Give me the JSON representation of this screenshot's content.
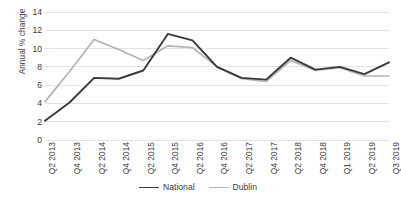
{
  "chart_data": {
    "type": "line",
    "title": "",
    "xlabel": "",
    "ylabel": "Annual % change",
    "ylim": [
      0,
      14
    ],
    "yticks": [
      0,
      2,
      4,
      6,
      8,
      10,
      12,
      14
    ],
    "grid": true,
    "legend_position": "bottom",
    "categories": [
      "Q2 2013",
      "Q4 2013",
      "Q2 2014",
      "Q4 2014",
      "Q2 2015",
      "Q4 2015",
      "Q2 2016",
      "Q4 2016",
      "Q2 2017",
      "Q4 2017",
      "Q2 2018",
      "Q4 2018",
      "Q1 2019",
      "Q2 2019",
      "Q3 2019"
    ],
    "series": [
      {
        "name": "National",
        "color": "#3a3a3a",
        "values": [
          2.1,
          4.1,
          6.8,
          6.7,
          7.6,
          11.6,
          10.9,
          8.0,
          6.8,
          6.6,
          9.0,
          7.7,
          8.0,
          7.2,
          8.5
        ]
      },
      {
        "name": "Dublin",
        "color": "#b4b4b4",
        "values": [
          4.2,
          7.5,
          11.0,
          9.9,
          8.7,
          10.3,
          10.1,
          8.0,
          6.7,
          6.4,
          8.7,
          7.6,
          7.9,
          7.0,
          7.0
        ]
      }
    ]
  },
  "axis": {
    "y_title": "Annual % change"
  },
  "legend": {
    "items": [
      {
        "label": "National",
        "color": "#3a3a3a"
      },
      {
        "label": "Dublin",
        "color": "#b4b4b4"
      }
    ]
  },
  "colors": {
    "national": "#3a3a3a",
    "dublin": "#b4b4b4",
    "gridline": "#e3e3e3",
    "text": "#3b3b3b",
    "background": "#ffffff"
  }
}
